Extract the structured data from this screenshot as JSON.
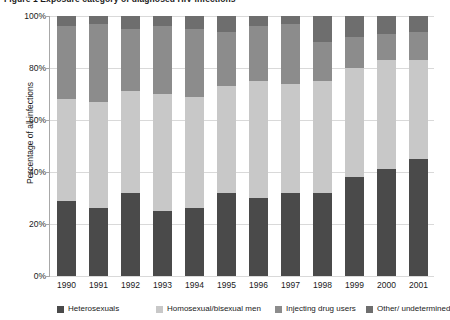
{
  "figure": {
    "title_partial": "Figure 1  Exposure category of diagnosed HIV infections"
  },
  "chart_data": {
    "type": "bar",
    "stacked": true,
    "stacked_mode": "percent",
    "title": "",
    "xlabel": "",
    "ylabel": "Percentage of all infections",
    "ylim": [
      0,
      100
    ],
    "ytick_labels": [
      "0%",
      "20%",
      "40%",
      "60%",
      "80%",
      "100%"
    ],
    "ytick_values": [
      0,
      20,
      40,
      60,
      80,
      100
    ],
    "grid": true,
    "grid_axis": "y",
    "legend_position": "bottom",
    "categories": [
      "1990",
      "1991",
      "1992",
      "1993",
      "1994",
      "1995",
      "1996",
      "1997",
      "1998",
      "1999",
      "2000",
      "2001"
    ],
    "series": [
      {
        "name": "Heterosexuals",
        "color": "#4a4a4a",
        "values": [
          29,
          26,
          32,
          25,
          26,
          32,
          30,
          32,
          32,
          38,
          41,
          45
        ]
      },
      {
        "name": "Homosexual/bisexual men",
        "color": "#c8c8c8",
        "values": [
          39,
          41,
          39,
          45,
          43,
          41,
          45,
          42,
          43,
          42,
          42,
          38
        ]
      },
      {
        "name": "Injecting drug users",
        "color": "#8c8c8c",
        "values": [
          28,
          30,
          24,
          26,
          26,
          21,
          21,
          23,
          15,
          12,
          10,
          11
        ]
      },
      {
        "name": "Other/ undetermined",
        "color": "#6e6e6e",
        "values": [
          4,
          3,
          5,
          4,
          5,
          6,
          4,
          3,
          10,
          8,
          7,
          6
        ]
      }
    ]
  },
  "legend": {
    "items": [
      {
        "label": "Heterosexuals",
        "color": "#4a4a4a",
        "left": 57
      },
      {
        "label": "Homosexual/bisexual men",
        "color": "#c8c8c8",
        "left": 156
      },
      {
        "label": "Injecting drug users",
        "color": "#8c8c8c",
        "left": 275
      },
      {
        "label": "Other/ undetermined",
        "color": "#6e6e6e",
        "left": 366
      }
    ]
  }
}
